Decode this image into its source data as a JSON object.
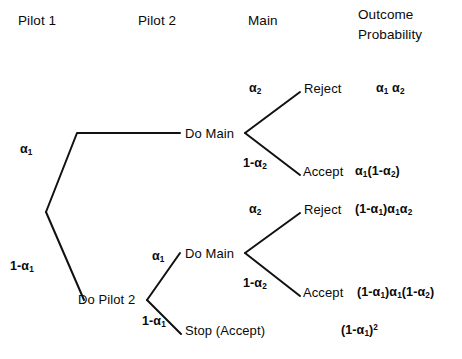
{
  "diagram": {
    "type": "decision-tree",
    "title_columns": [
      {
        "id": "pilot1",
        "label": "Pilot 1",
        "x": 18,
        "y": 14
      },
      {
        "id": "pilot2",
        "label": "Pilot 2",
        "x": 138,
        "y": 14
      },
      {
        "id": "main",
        "label": "Main",
        "x": 248,
        "y": 14
      },
      {
        "id": "outcome",
        "label": "Outcome",
        "x": 358,
        "y": 8
      },
      {
        "id": "probability",
        "label": "Probability",
        "x": 358,
        "y": 28
      }
    ],
    "nodes": [
      {
        "id": "root",
        "label": "",
        "x": 46,
        "y": 212
      },
      {
        "id": "do-main-upper",
        "label": "Do Main",
        "x": 185,
        "y": 127
      },
      {
        "id": "do-pilot-2",
        "label": "Do Pilot 2",
        "x": 78,
        "y": 293
      },
      {
        "id": "do-main-lower",
        "label": "Do Main",
        "x": 185,
        "y": 247
      }
    ],
    "outcomes": [
      {
        "id": "reject-1",
        "label": "Reject",
        "x": 304,
        "y": 82,
        "probability": "α₁ α₂",
        "prob_x": 376,
        "prob_y": 82
      },
      {
        "id": "accept-1",
        "label": "Accept",
        "x": 303,
        "y": 165,
        "probability": "α₁(1-α₂)",
        "prob_x": 355,
        "prob_y": 165
      },
      {
        "id": "reject-2",
        "label": "Reject",
        "x": 304,
        "y": 203,
        "probability": "(1-α₁)α₁α₂",
        "prob_x": 355,
        "prob_y": 203
      },
      {
        "id": "accept-2",
        "label": "Accept",
        "x": 303,
        "y": 286,
        "probability": "(1-α₁)α₁(1-α₂)",
        "prob_x": 357,
        "prob_y": 286
      },
      {
        "id": "stop-accept",
        "label": "Stop (Accept)",
        "x": 185,
        "y": 324,
        "probability": "(1-α₁)²",
        "prob_x": 341,
        "prob_y": 324
      }
    ],
    "branch_labels": [
      {
        "id": "alpha-1-upper",
        "label": "α₁",
        "x": 20,
        "y": 143
      },
      {
        "id": "one-minus-alpha-1-lower",
        "label": "1-α₁",
        "x": 10,
        "y": 260
      },
      {
        "id": "alpha-2-upper",
        "label": "α₂",
        "x": 249,
        "y": 82
      },
      {
        "id": "one-minus-alpha-2-upper",
        "label": "1-α₂",
        "x": 243,
        "y": 157
      },
      {
        "id": "alpha-1-inner",
        "label": "α₁",
        "x": 152,
        "y": 250
      },
      {
        "id": "one-minus-alpha-1-inner",
        "label": "1-α₁",
        "x": 142,
        "y": 315
      },
      {
        "id": "alpha-2-lower",
        "label": "α₂",
        "x": 249,
        "y": 203
      },
      {
        "id": "one-minus-alpha-2-lower",
        "label": "1-α₂",
        "x": 243,
        "y": 277
      }
    ],
    "edges": [
      {
        "id": "edge-root-to-upper",
        "points": "46,212 77,133 180,133"
      },
      {
        "id": "edge-root-to-pilot2",
        "points": "46,212 84,300"
      },
      {
        "id": "edge-upper-main-to-reject",
        "points": "245,133 300,92"
      },
      {
        "id": "edge-upper-main-to-accept",
        "points": "245,133 300,175"
      },
      {
        "id": "edge-pilot2-to-main",
        "points": "147,300 180,253"
      },
      {
        "id": "edge-pilot2-to-stop",
        "points": "147,300 181,334"
      },
      {
        "id": "edge-lower-main-to-reject",
        "points": "245,253 300,213"
      },
      {
        "id": "edge-lower-main-to-accept",
        "points": "245,253 300,296"
      }
    ],
    "style": {
      "line_color": "#111111",
      "line_width": 2,
      "background": "#ffffff"
    }
  }
}
